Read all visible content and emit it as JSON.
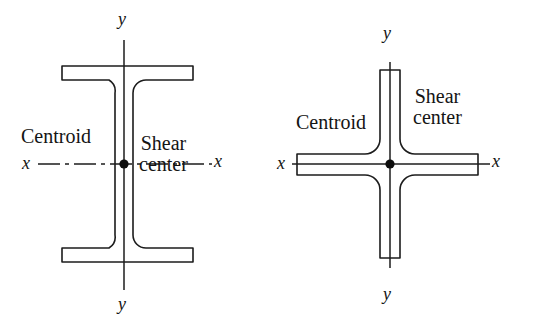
{
  "figure": {
    "stroke_color": "#1c1c1c",
    "background_color": "#ffffff",
    "dot_color": "#0d0d0d"
  },
  "diagrams": [
    {
      "id": "wide-flange-beam",
      "shape_name": "I-beam wide flange section",
      "labels": {
        "centroid": "Centroid",
        "shear_line1": "Shear",
        "shear_line2": "center",
        "axis_x_left": "x",
        "axis_x_right": "x",
        "axis_y_top": "y",
        "axis_y_bottom": "y"
      },
      "geometry": {
        "center": [
          124,
          164
        ],
        "flange_left": 62,
        "flange_right": 193,
        "top_flange_top": 66,
        "top_flange_bottom": 80,
        "bottom_flange_top": 248,
        "bottom_flange_bottom": 262,
        "web_left": 115,
        "web_right": 133,
        "fillet_radius": 13,
        "axis_x_span": [
          38,
          212
        ],
        "axis_y_span": [
          40,
          290
        ],
        "dot_radius": 4.6,
        "axis_style": "dash-dot"
      },
      "label_positions": {
        "centroid": [
          21,
          126
        ],
        "shear_line1": [
          139,
          133
        ],
        "shear_line2": [
          139,
          156
        ],
        "axis_x_left": [
          22,
          154
        ],
        "axis_x_right": [
          214,
          152
        ],
        "axis_y_top": [
          118,
          10
        ],
        "axis_y_bottom": [
          118,
          295
        ]
      }
    },
    {
      "id": "cruciform-section",
      "shape_name": "Cruciform cross section",
      "labels": {
        "centroid": "Centroid",
        "shear_line1": "Shear",
        "shear_line2": "center",
        "axis_x_left": "x",
        "axis_x_right": "x",
        "axis_y_top": "y",
        "axis_y_bottom": "y"
      },
      "geometry": {
        "center": [
          390,
          164
        ],
        "arm_left": 297,
        "arm_right": 478,
        "arm_top": 70,
        "arm_bottom": 258,
        "horiz_arm_top": 154,
        "horiz_arm_bottom": 175,
        "vert_arm_left": 380,
        "vert_arm_right": 400,
        "fillet_radius": 15,
        "axis_x_span": [
          292,
          490
        ],
        "axis_y_span": [
          62,
          268
        ],
        "dot_radius": 4.6,
        "axis_style": "solid"
      },
      "label_positions": {
        "centroid": [
          296,
          112
        ],
        "shear_line1": [
          413,
          86
        ],
        "shear_line2": [
          413,
          110
        ],
        "axis_x_left": [
          277,
          154
        ],
        "axis_x_right": [
          492,
          152
        ],
        "axis_y_top": [
          383,
          24
        ],
        "axis_y_bottom": [
          383,
          285
        ]
      }
    }
  ]
}
